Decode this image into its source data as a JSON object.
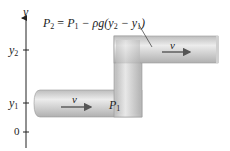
{
  "axis": {
    "label": "y",
    "ticks": [
      {
        "name": "y2",
        "label": "y",
        "sub": "2"
      },
      {
        "name": "y1",
        "label": "y",
        "sub": "1"
      },
      {
        "name": "zero",
        "label": "0"
      }
    ]
  },
  "equation": {
    "p2": "P",
    "p2_sub": "2",
    "eq": " = ",
    "p1": "P",
    "p1_sub": "1",
    "minus": " − ρg(y",
    "y2_sub": "2",
    "mid": " − y",
    "y1_sub": "1",
    "close": ")"
  },
  "upper_pipe": {
    "velocity_label": "v"
  },
  "lower_pipe": {
    "velocity_label": "v",
    "pressure_label": "P",
    "pressure_sub": "1"
  },
  "colors": {
    "pipe_light": "#e6e6e6",
    "pipe_dark": "#a8a8a8",
    "arrow": "#555555",
    "axis": "#222222"
  }
}
